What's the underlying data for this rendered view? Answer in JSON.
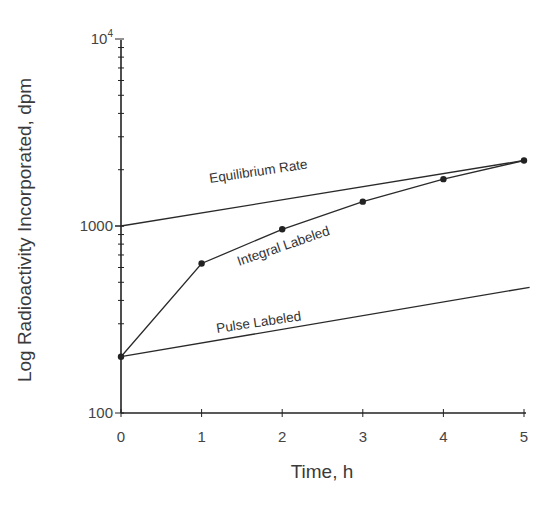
{
  "chart_data": {
    "type": "line",
    "title": "",
    "xlabel": "Time, h",
    "ylabel": "Log Radioactivity Incorporated, dpm",
    "yscale": "log",
    "xlim": [
      0,
      5
    ],
    "ylim": [
      100,
      10000
    ],
    "x_ticks": [
      "0",
      "1",
      "2",
      "3",
      "4",
      "5"
    ],
    "y_ticks": [
      {
        "value": 100,
        "label": "100"
      },
      {
        "value": 1000,
        "label": "1000"
      },
      {
        "value": 10000,
        "label": "10",
        "sup": "4"
      }
    ],
    "grid": false,
    "legend": "inline labels",
    "series": [
      {
        "name": "Equilibrium Rate",
        "x": [
          0,
          5
        ],
        "values": [
          1000,
          2240
        ],
        "markers": false
      },
      {
        "name": "Integral Labeled",
        "x": [
          0,
          1,
          2,
          3,
          4,
          5
        ],
        "values": [
          200,
          630,
          960,
          1350,
          1780,
          2240
        ],
        "markers": true
      },
      {
        "name": "Pulse Labeled",
        "x": [
          0,
          5.07
        ],
        "values": [
          200,
          470
        ],
        "markers": false
      }
    ]
  }
}
